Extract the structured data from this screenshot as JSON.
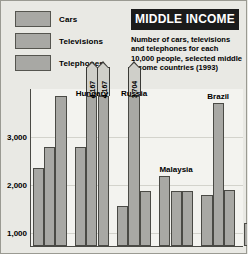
{
  "legend": {
    "items": [
      {
        "label": "Cars",
        "color": "#a8a8a4"
      },
      {
        "label": "Televisions",
        "color": "#a8a8a4"
      },
      {
        "label": "Telephones",
        "color": "#a8a8a4"
      }
    ]
  },
  "title": "MIDDLE INCOME",
  "caption": "Number of cars, televisions and telephones for each 10,000 people, selected middle income countries (1993)",
  "chart_data": {
    "type": "bar",
    "title": "MIDDLE INCOME",
    "subtitle": "Number of cars, televisions and telephones for each 10,000 people, selected middle income countries (1993)",
    "xlabel": "",
    "ylabel": "",
    "ylim": [
      0,
      3300
    ],
    "yticks": [
      1000,
      2000,
      3000
    ],
    "ytick_labels": [
      "1,000",
      "2,000",
      "3,000"
    ],
    "grid": true,
    "legend_position": "top-left",
    "categories": [
      "Poland",
      "Hungary",
      "Russia",
      "Malaysia",
      "Brazil",
      "Jordan"
    ],
    "visible_category_labels": [
      "Hungary",
      "Russia",
      "Malaysia",
      "Brazil",
      "Jordan"
    ],
    "series": [
      {
        "name": "Cars",
        "values": [
          1650,
          2080,
          840,
          1470,
          1080,
          490
        ]
      },
      {
        "name": "Televisions",
        "values": [
          2080,
          4167,
          3704,
          1160,
          3010,
          640
        ]
      },
      {
        "name": "Telephones",
        "values": [
          3150,
          4167,
          1160,
          1160,
          1180,
          790
        ]
      }
    ],
    "data_labels": [
      {
        "category": "Hungary",
        "series": "Televisions",
        "value": 4167,
        "text": "4,167"
      },
      {
        "category": "Hungary",
        "series": "Telephones",
        "value": 4167,
        "text": "4,167"
      },
      {
        "category": "Russia",
        "series": "Televisions",
        "value": 3704,
        "text": "3,704"
      }
    ]
  },
  "axis": {
    "tick_labels": [
      "3,000",
      "2,000",
      "1,000"
    ]
  },
  "countries": [
    {
      "name": "Hungary"
    },
    {
      "name": "Russia"
    },
    {
      "name": "Malaysia"
    },
    {
      "name": "Brazil"
    },
    {
      "name": "Jordan"
    }
  ]
}
